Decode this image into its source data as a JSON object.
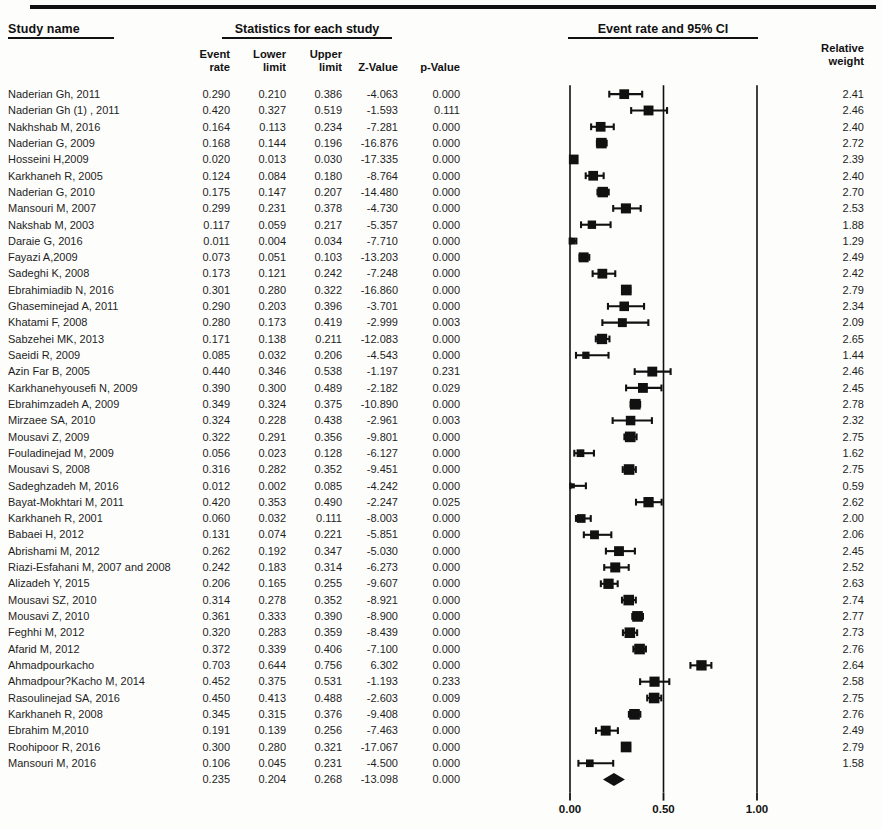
{
  "headers": {
    "study_name": "Study name",
    "statistics": "Statistics for each study",
    "plot": "Event rate and 95% CI",
    "event_rate": "Event\nrate",
    "lower_limit": "Lower\nlimit",
    "upper_limit": "Upper\nlimit",
    "z_value": "Z-Value",
    "p_value": "p-Value",
    "relative_weight": "Relative\nweight"
  },
  "axis": {
    "ticks": [
      "0.00",
      "0.50",
      "1.00"
    ],
    "tick_values": [
      0.0,
      0.5,
      1.0
    ],
    "min": 0.0,
    "max": 1.0
  },
  "colors": {
    "marker": "#111111",
    "line": "#111111",
    "text": "#1d1d1d",
    "background": "#fdfdfc"
  },
  "chart_data": {
    "type": "forest",
    "title": "Event rate and 95% CI",
    "xlabel": "",
    "ylabel": "",
    "xlim": [
      0.0,
      1.0
    ],
    "xticks": [
      0.0,
      0.5,
      1.0
    ],
    "xticklabels": [
      "0.00",
      "0.50",
      "1.00"
    ],
    "grid": false,
    "reference_lines": [
      0.0,
      0.5,
      1.0
    ],
    "columns": [
      "Study name",
      "Event rate",
      "Lower limit",
      "Upper limit",
      "Z-Value",
      "p-Value",
      "Relative weight"
    ],
    "rows": [
      {
        "name": "Naderian Gh, 2011",
        "event_rate": "0.290",
        "lower": "0.210",
        "upper": "0.386",
        "z": "-4.063",
        "p": "0.000",
        "weight": "2.41",
        "er": 0.29,
        "lo": 0.21,
        "hi": 0.386,
        "w": 2.41
      },
      {
        "name": "Naderian Gh (1) , 2011",
        "event_rate": "0.420",
        "lower": "0.327",
        "upper": "0.519",
        "z": "-1.593",
        "p": "0.111",
        "weight": "2.46",
        "er": 0.42,
        "lo": 0.327,
        "hi": 0.519,
        "w": 2.46
      },
      {
        "name": "Nakhshab M, 2016",
        "event_rate": "0.164",
        "lower": "0.113",
        "upper": "0.234",
        "z": "-7.281",
        "p": "0.000",
        "weight": "2.40",
        "er": 0.164,
        "lo": 0.113,
        "hi": 0.234,
        "w": 2.4
      },
      {
        "name": "Naderian G, 2009",
        "event_rate": "0.168",
        "lower": "0.144",
        "upper": "0.196",
        "z": "-16.876",
        "p": "0.000",
        "weight": "2.72",
        "er": 0.168,
        "lo": 0.144,
        "hi": 0.196,
        "w": 2.72
      },
      {
        "name": "Hosseini H,2009",
        "event_rate": "0.020",
        "lower": "0.013",
        "upper": "0.030",
        "z": "-17.335",
        "p": "0.000",
        "weight": "2.39",
        "er": 0.02,
        "lo": 0.013,
        "hi": 0.03,
        "w": 2.39
      },
      {
        "name": "Karkhaneh R, 2005",
        "event_rate": "0.124",
        "lower": "0.084",
        "upper": "0.180",
        "z": "-8.764",
        "p": "0.000",
        "weight": "2.40",
        "er": 0.124,
        "lo": 0.084,
        "hi": 0.18,
        "w": 2.4
      },
      {
        "name": "Naderian G, 2010",
        "event_rate": "0.175",
        "lower": "0.147",
        "upper": "0.207",
        "z": "-14.480",
        "p": "0.000",
        "weight": "2.70",
        "er": 0.175,
        "lo": 0.147,
        "hi": 0.207,
        "w": 2.7
      },
      {
        "name": "Mansouri M, 2007",
        "event_rate": "0.299",
        "lower": "0.231",
        "upper": "0.378",
        "z": "-4.730",
        "p": "0.000",
        "weight": "2.53",
        "er": 0.299,
        "lo": 0.231,
        "hi": 0.378,
        "w": 2.53
      },
      {
        "name": "Nakshab M, 2003",
        "event_rate": "0.117",
        "lower": "0.059",
        "upper": "0.217",
        "z": "-5.357",
        "p": "0.000",
        "weight": "1.88",
        "er": 0.117,
        "lo": 0.059,
        "hi": 0.217,
        "w": 1.88
      },
      {
        "name": "Daraie G, 2016",
        "event_rate": "0.011",
        "lower": "0.004",
        "upper": "0.034",
        "z": "-7.710",
        "p": "0.000",
        "weight": "1.29",
        "er": 0.011,
        "lo": 0.004,
        "hi": 0.034,
        "w": 1.29
      },
      {
        "name": "Fayazi A,2009",
        "event_rate": "0.073",
        "lower": "0.051",
        "upper": "0.103",
        "z": "-13.203",
        "p": "0.000",
        "weight": "2.49",
        "er": 0.073,
        "lo": 0.051,
        "hi": 0.103,
        "w": 2.49
      },
      {
        "name": "Sadeghi K, 2008",
        "event_rate": "0.173",
        "lower": "0.121",
        "upper": "0.242",
        "z": "-7.248",
        "p": "0.000",
        "weight": "2.42",
        "er": 0.173,
        "lo": 0.121,
        "hi": 0.242,
        "w": 2.42
      },
      {
        "name": "Ebrahimiadib N, 2016",
        "event_rate": "0.301",
        "lower": "0.280",
        "upper": "0.322",
        "z": "-16.860",
        "p": "0.000",
        "weight": "2.79",
        "er": 0.301,
        "lo": 0.28,
        "hi": 0.322,
        "w": 2.79
      },
      {
        "name": "Ghaseminejad A, 2011",
        "event_rate": "0.290",
        "lower": "0.203",
        "upper": "0.396",
        "z": "-3.701",
        "p": "0.000",
        "weight": "2.34",
        "er": 0.29,
        "lo": 0.203,
        "hi": 0.396,
        "w": 2.34
      },
      {
        "name": "Khatami F, 2008",
        "event_rate": "0.280",
        "lower": "0.173",
        "upper": "0.419",
        "z": "-2.999",
        "p": "0.003",
        "weight": "2.09",
        "er": 0.28,
        "lo": 0.173,
        "hi": 0.419,
        "w": 2.09
      },
      {
        "name": "Sabzehei MK, 2013",
        "event_rate": "0.171",
        "lower": "0.138",
        "upper": "0.211",
        "z": "-12.083",
        "p": "0.000",
        "weight": "2.65",
        "er": 0.171,
        "lo": 0.138,
        "hi": 0.211,
        "w": 2.65
      },
      {
        "name": "Saeidi R, 2009",
        "event_rate": "0.085",
        "lower": "0.032",
        "upper": "0.206",
        "z": "-4.543",
        "p": "0.000",
        "weight": "1.44",
        "er": 0.085,
        "lo": 0.032,
        "hi": 0.206,
        "w": 1.44
      },
      {
        "name": "Azin Far B, 2005",
        "event_rate": "0.440",
        "lower": "0.346",
        "upper": "0.538",
        "z": "-1.197",
        "p": "0.231",
        "weight": "2.46",
        "er": 0.44,
        "lo": 0.346,
        "hi": 0.538,
        "w": 2.46
      },
      {
        "name": "Karkhanehyousefi N, 2009",
        "event_rate": "0.390",
        "lower": "0.300",
        "upper": "0.489",
        "z": "-2.182",
        "p": "0.029",
        "weight": "2.45",
        "er": 0.39,
        "lo": 0.3,
        "hi": 0.489,
        "w": 2.45
      },
      {
        "name": "Ebrahimzadeh A, 2009",
        "event_rate": "0.349",
        "lower": "0.324",
        "upper": "0.375",
        "z": "-10.890",
        "p": "0.000",
        "weight": "2.78",
        "er": 0.349,
        "lo": 0.324,
        "hi": 0.375,
        "w": 2.78
      },
      {
        "name": "Mirzaee SA, 2010",
        "event_rate": "0.324",
        "lower": "0.228",
        "upper": "0.438",
        "z": "-2.961",
        "p": "0.003",
        "weight": "2.32",
        "er": 0.324,
        "lo": 0.228,
        "hi": 0.438,
        "w": 2.32
      },
      {
        "name": "Mousavi Z, 2009",
        "event_rate": "0.322",
        "lower": "0.291",
        "upper": "0.356",
        "z": "-9.801",
        "p": "0.000",
        "weight": "2.75",
        "er": 0.322,
        "lo": 0.291,
        "hi": 0.356,
        "w": 2.75
      },
      {
        "name": "Fouladinejad M, 2009",
        "event_rate": "0.056",
        "lower": "0.023",
        "upper": "0.128",
        "z": "-6.127",
        "p": "0.000",
        "weight": "1.62",
        "er": 0.056,
        "lo": 0.023,
        "hi": 0.128,
        "w": 1.62
      },
      {
        "name": "Mousavi S, 2008",
        "event_rate": "0.316",
        "lower": "0.282",
        "upper": "0.352",
        "z": "-9.451",
        "p": "0.000",
        "weight": "2.75",
        "er": 0.316,
        "lo": 0.282,
        "hi": 0.352,
        "w": 2.75
      },
      {
        "name": "Sadeghzadeh M, 2016",
        "event_rate": "0.012",
        "lower": "0.002",
        "upper": "0.085",
        "z": "-4.242",
        "p": "0.000",
        "weight": "0.59",
        "er": 0.012,
        "lo": 0.002,
        "hi": 0.085,
        "w": 0.59
      },
      {
        "name": "Bayat-Mokhtari M, 2011",
        "event_rate": "0.420",
        "lower": "0.353",
        "upper": "0.490",
        "z": "-2.247",
        "p": "0.025",
        "weight": "2.62",
        "er": 0.42,
        "lo": 0.353,
        "hi": 0.49,
        "w": 2.62
      },
      {
        "name": "Karkhaneh R, 2001",
        "event_rate": "0.060",
        "lower": "0.032",
        "upper": "0.111",
        "z": "-8.003",
        "p": "0.000",
        "weight": "2.00",
        "er": 0.06,
        "lo": 0.032,
        "hi": 0.111,
        "w": 2.0
      },
      {
        "name": "Babaei H, 2012",
        "event_rate": "0.131",
        "lower": "0.074",
        "upper": "0.221",
        "z": "-5.851",
        "p": "0.000",
        "weight": "2.06",
        "er": 0.131,
        "lo": 0.074,
        "hi": 0.221,
        "w": 2.06
      },
      {
        "name": "Abrishami M, 2012",
        "event_rate": "0.262",
        "lower": "0.192",
        "upper": "0.347",
        "z": "-5.030",
        "p": "0.000",
        "weight": "2.45",
        "er": 0.262,
        "lo": 0.192,
        "hi": 0.347,
        "w": 2.45
      },
      {
        "name": "Riazi-Esfahani M, 2007 and 2008",
        "event_rate": "0.242",
        "lower": "0.183",
        "upper": "0.314",
        "z": "-6.273",
        "p": "0.000",
        "weight": "2.52",
        "er": 0.242,
        "lo": 0.183,
        "hi": 0.314,
        "w": 2.52
      },
      {
        "name": "Alizadeh Y, 2015",
        "event_rate": "0.206",
        "lower": "0.165",
        "upper": "0.255",
        "z": "-9.607",
        "p": "0.000",
        "weight": "2.63",
        "er": 0.206,
        "lo": 0.165,
        "hi": 0.255,
        "w": 2.63
      },
      {
        "name": "Mousavi SZ, 2010",
        "event_rate": "0.314",
        "lower": "0.278",
        "upper": "0.352",
        "z": "-8.921",
        "p": "0.000",
        "weight": "2.74",
        "er": 0.314,
        "lo": 0.278,
        "hi": 0.352,
        "w": 2.74
      },
      {
        "name": "Mousavi Z, 2010",
        "event_rate": "0.361",
        "lower": "0.333",
        "upper": "0.390",
        "z": "-8.900",
        "p": "0.000",
        "weight": "2.77",
        "er": 0.361,
        "lo": 0.333,
        "hi": 0.39,
        "w": 2.77
      },
      {
        "name": "Feghhi M, 2012",
        "event_rate": "0.320",
        "lower": "0.283",
        "upper": "0.359",
        "z": "-8.439",
        "p": "0.000",
        "weight": "2.73",
        "er": 0.32,
        "lo": 0.283,
        "hi": 0.359,
        "w": 2.73
      },
      {
        "name": "Afarid M, 2012",
        "event_rate": "0.372",
        "lower": "0.339",
        "upper": "0.406",
        "z": "-7.100",
        "p": "0.000",
        "weight": "2.76",
        "er": 0.372,
        "lo": 0.339,
        "hi": 0.406,
        "w": 2.76
      },
      {
        "name": "Ahmadpourkacho",
        "event_rate": "0.703",
        "lower": "0.644",
        "upper": "0.756",
        "z": "6.302",
        "p": "0.000",
        "weight": "2.64",
        "er": 0.703,
        "lo": 0.644,
        "hi": 0.756,
        "w": 2.64
      },
      {
        "name": "Ahmadpour?Kacho M, 2014",
        "event_rate": "0.452",
        "lower": "0.375",
        "upper": "0.531",
        "z": "-1.193",
        "p": "0.233",
        "weight": "2.58",
        "er": 0.452,
        "lo": 0.375,
        "hi": 0.531,
        "w": 2.58
      },
      {
        "name": "Rasoulinejad SA, 2016",
        "event_rate": "0.450",
        "lower": "0.413",
        "upper": "0.488",
        "z": "-2.603",
        "p": "0.009",
        "weight": "2.75",
        "er": 0.45,
        "lo": 0.413,
        "hi": 0.488,
        "w": 2.75
      },
      {
        "name": "Karkhaneh R, 2008",
        "event_rate": "0.345",
        "lower": "0.315",
        "upper": "0.376",
        "z": "-9.408",
        "p": "0.000",
        "weight": "2.76",
        "er": 0.345,
        "lo": 0.315,
        "hi": 0.376,
        "w": 2.76
      },
      {
        "name": "Ebrahim M,2010",
        "event_rate": "0.191",
        "lower": "0.139",
        "upper": "0.256",
        "z": "-7.463",
        "p": "0.000",
        "weight": "2.49",
        "er": 0.191,
        "lo": 0.139,
        "hi": 0.256,
        "w": 2.49
      },
      {
        "name": "Roohipoor R, 2016",
        "event_rate": "0.300",
        "lower": "0.280",
        "upper": "0.321",
        "z": "-17.067",
        "p": "0.000",
        "weight": "2.79",
        "er": 0.3,
        "lo": 0.28,
        "hi": 0.321,
        "w": 2.79
      },
      {
        "name": "Mansouri M, 2016",
        "event_rate": "0.106",
        "lower": "0.045",
        "upper": "0.231",
        "z": "-4.500",
        "p": "0.000",
        "weight": "1.58",
        "er": 0.106,
        "lo": 0.045,
        "hi": 0.231,
        "w": 1.58
      },
      {
        "name": "",
        "event_rate": "0.235",
        "lower": "0.204",
        "upper": "0.268",
        "z": "-13.098",
        "p": "0.000",
        "weight": "",
        "er": 0.235,
        "lo": 0.204,
        "hi": 0.268,
        "w": 0,
        "summary": true
      }
    ]
  }
}
